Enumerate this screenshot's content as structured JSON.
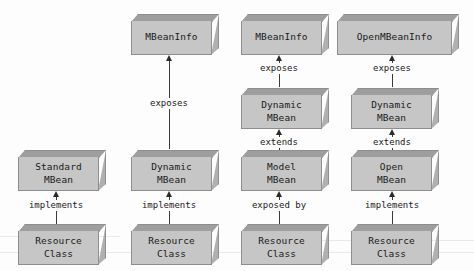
{
  "diagram": {
    "type": "uml-class-diagram",
    "background_color": "#fdfdfd",
    "box_fill_color": "#c6c6c6",
    "box_top_color": "#9e9e9e",
    "box_border_color": "#8e8e8e",
    "arrow_color": "#3a3a3a"
  },
  "columns": [
    {
      "id": "standard-mbean-column",
      "nodes": [
        {
          "id": "standard-mbean",
          "line1": "Standard",
          "line2": "MBean"
        },
        {
          "id": "resource-class-1",
          "line1": "Resource",
          "line2": "Class"
        }
      ],
      "edges": [
        {
          "id": "edge-implements-1",
          "label": "implements",
          "from": "resource-class-1",
          "to": "standard-mbean"
        }
      ]
    },
    {
      "id": "dynamic-mbean-column",
      "nodes": [
        {
          "id": "mbeaninfo-1",
          "line1": "MBeanInfo",
          "line2": ""
        },
        {
          "id": "dynamic-mbean-1",
          "line1": "Dynamic",
          "line2": "MBean"
        },
        {
          "id": "resource-class-2",
          "line1": "Resource",
          "line2": "Class"
        }
      ],
      "edges": [
        {
          "id": "edge-exposes-1",
          "label": "exposes",
          "from": "dynamic-mbean-1",
          "to": "mbeaninfo-1"
        },
        {
          "id": "edge-implements-2",
          "label": "implements",
          "from": "resource-class-2",
          "to": "dynamic-mbean-1"
        }
      ]
    },
    {
      "id": "model-mbean-column",
      "nodes": [
        {
          "id": "mbeaninfo-2",
          "line1": "MBeanInfo",
          "line2": ""
        },
        {
          "id": "dynamic-mbean-2",
          "line1": "Dynamic",
          "line2": "MBean"
        },
        {
          "id": "model-mbean",
          "line1": "Model",
          "line2": "MBean"
        },
        {
          "id": "resource-class-3",
          "line1": "Resource",
          "line2": "Class"
        }
      ],
      "edges": [
        {
          "id": "edge-exposes-2",
          "label": "exposes",
          "from": "dynamic-mbean-2",
          "to": "mbeaninfo-2"
        },
        {
          "id": "edge-extends-1",
          "label": "extends",
          "from": "model-mbean",
          "to": "dynamic-mbean-2"
        },
        {
          "id": "edge-exposed-by-1",
          "label": "exposed by",
          "from": "resource-class-3",
          "to": "model-mbean"
        }
      ]
    },
    {
      "id": "open-mbean-column",
      "nodes": [
        {
          "id": "openmbeaninfo",
          "line1": "OpenMBeanInfo",
          "line2": ""
        },
        {
          "id": "dynamic-mbean-3",
          "line1": "Dynamic",
          "line2": "MBean"
        },
        {
          "id": "open-mbean",
          "line1": "Open",
          "line2": "MBean"
        },
        {
          "id": "resource-class-4",
          "line1": "Resource",
          "line2": "Class"
        }
      ],
      "edges": [
        {
          "id": "edge-exposes-3",
          "label": "exposes",
          "from": "dynamic-mbean-3",
          "to": "openmbeaninfo"
        },
        {
          "id": "edge-extends-2",
          "label": "extends",
          "from": "open-mbean",
          "to": "dynamic-mbean-3"
        },
        {
          "id": "edge-implements-3",
          "label": "implements",
          "from": "resource-class-4",
          "to": "open-mbean"
        }
      ]
    }
  ]
}
